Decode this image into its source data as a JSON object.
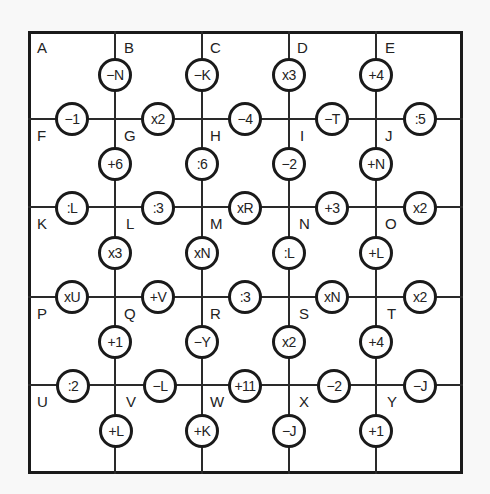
{
  "cells": [
    "A",
    "B",
    "C",
    "D",
    "E",
    "F",
    "G",
    "H",
    "I",
    "J",
    "K",
    "L",
    "M",
    "N",
    "O",
    "P",
    "Q",
    "R",
    "S",
    "T",
    "U",
    "V",
    "W",
    "X",
    "Y"
  ],
  "vertical_ops": [
    [
      "−N",
      "−K",
      "x3",
      "+4"
    ],
    [
      "+6",
      ":6",
      "−2",
      "+N"
    ],
    [
      "x3",
      "xN",
      ":L",
      "+L"
    ],
    [
      "+1",
      "−Y",
      "x2",
      "+4"
    ],
    [
      "+L",
      "+K",
      "−J",
      "+1"
    ]
  ],
  "horizontal_ops": [
    [
      "−1",
      "x2",
      "−4",
      "−T",
      ":5"
    ],
    [
      ":L",
      ":3",
      "xR",
      "+3",
      "x2"
    ],
    [
      "xU",
      "+V",
      ":3",
      "xN",
      "x2"
    ],
    [
      ":2",
      "−L",
      "+11",
      "−2",
      "−J"
    ]
  ],
  "colors": {
    "line": "#1a1a1a",
    "background": "#f8f8f8",
    "cell": "#ffffff"
  }
}
